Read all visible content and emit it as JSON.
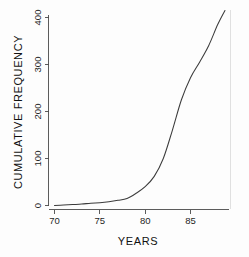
{
  "chart_data": {
    "type": "line",
    "title": "",
    "subtitle": "",
    "xlabel": "YEARS",
    "ylabel": "CUMULATIVE FREQUENCY",
    "xlim": [
      69.2,
      89.2
    ],
    "ylim": [
      -12,
      430
    ],
    "xticks": [
      70,
      75,
      80,
      85
    ],
    "xticklabels": [
      "70",
      "75",
      "80",
      "85"
    ],
    "yticks": [
      0,
      100,
      200,
      300,
      400
    ],
    "yticklabels": [
      "0",
      "100",
      "200",
      "300",
      "400"
    ],
    "grid": false,
    "legend": null,
    "legend_position": "none",
    "annotations": [],
    "series": [
      {
        "name": "Cumulative frequency",
        "color": "#3b3b3b",
        "x": [
          70.0,
          71.0,
          72.0,
          73.0,
          74.0,
          75.0,
          76.0,
          77.0,
          78.0,
          79.0,
          80.0,
          81.0,
          82.0,
          83.0,
          84.0,
          85.0,
          86.0,
          87.0,
          88.0,
          88.8
        ],
        "y": [
          0,
          1,
          2,
          3,
          5,
          6,
          8,
          11,
          15,
          26,
          40,
          62,
          100,
          160,
          225,
          272,
          305,
          340,
          385,
          415
        ]
      }
    ]
  },
  "axes": {
    "y_axis_label": "CUMULATIVE FREQUENCY",
    "x_axis_label": "YEARS"
  }
}
